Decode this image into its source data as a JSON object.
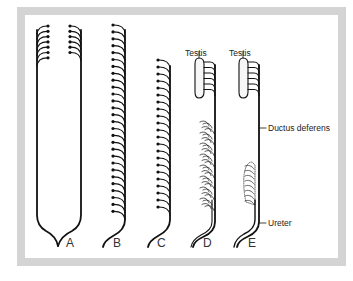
{
  "figure": {
    "frame_color": "#d4d4d4",
    "line_color": "#111111",
    "panels": [
      {
        "id": "A",
        "label": "A",
        "left_tubules": 7,
        "right_tubules": 6
      },
      {
        "id": "B",
        "label": "B",
        "tubules": 28
      },
      {
        "id": "C",
        "label": "C",
        "tubules": 22
      },
      {
        "id": "D",
        "label": "D",
        "top_label": "Testis"
      },
      {
        "id": "E",
        "label": "E",
        "top_label": "Testis"
      }
    ],
    "annotations": {
      "ductus_deferens": "Ductus deferens",
      "ureter": "Ureter"
    }
  }
}
